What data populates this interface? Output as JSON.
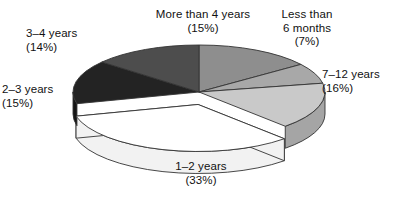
{
  "chart_data": {
    "type": "pie",
    "title": "",
    "subtitle": "",
    "xlabel": "",
    "ylabel": "",
    "legend_position": "none",
    "grid": false,
    "style": "3d-exploded-pie",
    "value_unit": "percent",
    "categories": [
      "More than 4 years",
      "Less than 6 months",
      "7–12 years",
      "1–2 years",
      "2–3 years",
      "3–4 years"
    ],
    "values": [
      15,
      7,
      16,
      33,
      15,
      14
    ],
    "total": 100,
    "slices": [
      {
        "label": "More than 4 years",
        "value": 15,
        "percent_text": "(15%)",
        "label_line1": "More than 4 years",
        "label_line2": "(15%)",
        "label_line3": "",
        "color": "#8e8e8e",
        "side_color": "#6f6f6f",
        "exploded": false
      },
      {
        "label": "Less than 6 months",
        "value": 7,
        "percent_text": "(7%)",
        "label_line1": "Less than",
        "label_line2": "6 months",
        "label_line3": "(7%)",
        "color": "#a8a8a8",
        "side_color": "#878787",
        "exploded": false
      },
      {
        "label": "7–12 years",
        "value": 16,
        "percent_text": "(16%)",
        "label_line1": "7–12 years",
        "label_line2": "(16%)",
        "label_line3": "",
        "color": "#c9c9c9",
        "side_color": "#a5a5a5",
        "exploded": false
      },
      {
        "label": "1–2 years",
        "value": 33,
        "percent_text": "(33%)",
        "label_line1": "1–2 years",
        "label_line2": "(33%)",
        "label_line3": "",
        "color": "#ffffff",
        "side_color": "#f2f2f2",
        "exploded": true
      },
      {
        "label": "2–3 years",
        "value": 15,
        "percent_text": "(15%)",
        "label_line1": "2–3 years",
        "label_line2": "(15%)",
        "label_line3": "",
        "color": "#232323",
        "side_color": "#141414",
        "exploded": false
      },
      {
        "label": "3–4 years",
        "value": 14,
        "percent_text": "(14%)",
        "label_line1": "3–4 years",
        "label_line2": "(14%)",
        "label_line3": "",
        "color": "#4d4d4d",
        "side_color": "#383838",
        "exploded": false
      }
    ],
    "colors": {
      "background": "#ffffff",
      "text": "#111111",
      "outline": "#333333"
    }
  }
}
